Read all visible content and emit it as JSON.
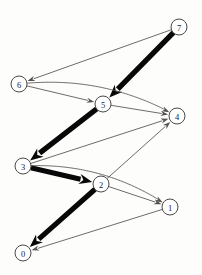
{
  "figure": {
    "kind": "directed-graph-diagram",
    "background_color": "#fdfdfc",
    "width": 202,
    "height": 275
  },
  "graph": {
    "node_radius": 8,
    "node_fill": "#ffffff",
    "node_stroke": "#4a4a4a",
    "thin_edge_color": "#55514d",
    "thick_edge_color": "#080808",
    "nodes": [
      {
        "id": "0",
        "label": "0",
        "x": 23,
        "y": 253
      },
      {
        "id": "1",
        "label": "1",
        "x": 170,
        "y": 207
      },
      {
        "id": "2",
        "label": "2",
        "x": 101,
        "y": 184
      },
      {
        "id": "3",
        "label": "3",
        "x": 23,
        "y": 166
      },
      {
        "id": "4",
        "label": "4",
        "x": 177,
        "y": 116
      },
      {
        "id": "5",
        "label": "5",
        "x": 103,
        "y": 104
      },
      {
        "id": "6",
        "label": "6",
        "x": 19,
        "y": 84
      },
      {
        "id": "7",
        "label": "7",
        "x": 179,
        "y": 27
      }
    ],
    "edges": [
      {
        "from": "7",
        "to": "6",
        "weight": "thin",
        "shape": "straight"
      },
      {
        "from": "7",
        "to": "5",
        "weight": "thick",
        "shape": "straight"
      },
      {
        "from": "6",
        "to": "5",
        "weight": "thin",
        "shape": "straight"
      },
      {
        "from": "6",
        "to": "4",
        "weight": "thin",
        "shape": "curved"
      },
      {
        "from": "5",
        "to": "4",
        "weight": "thin",
        "shape": "straight"
      },
      {
        "from": "5",
        "to": "3",
        "weight": "thick",
        "shape": "straight"
      },
      {
        "from": "3",
        "to": "4",
        "weight": "thin",
        "shape": "straight"
      },
      {
        "from": "3",
        "to": "2",
        "weight": "thick",
        "shape": "straight"
      },
      {
        "from": "3",
        "to": "1",
        "weight": "thin",
        "shape": "curved"
      },
      {
        "from": "2",
        "to": "4",
        "weight": "thin",
        "shape": "straight"
      },
      {
        "from": "2",
        "to": "1",
        "weight": "thin",
        "shape": "straight"
      },
      {
        "from": "2",
        "to": "0",
        "weight": "thick",
        "shape": "straight"
      },
      {
        "from": "1",
        "to": "0",
        "weight": "thin",
        "shape": "straight"
      }
    ]
  }
}
